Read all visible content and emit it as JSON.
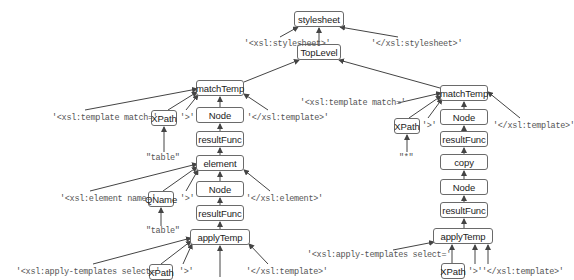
{
  "diagram": {
    "type": "parse-tree",
    "nodes": [
      {
        "id": "stylesheet",
        "label": "stylesheet",
        "x": 294,
        "y": 11,
        "w": 50,
        "h": 16
      },
      {
        "id": "toplevel",
        "label": "TopLevel",
        "x": 297,
        "y": 44,
        "w": 44,
        "h": 16
      },
      {
        "id": "l_matchtemp",
        "label": "matchTemp",
        "x": 196,
        "y": 80,
        "w": 48,
        "h": 16
      },
      {
        "id": "l_xpath",
        "label": "XPath",
        "x": 151,
        "y": 110,
        "w": 26,
        "h": 16
      },
      {
        "id": "l_node1",
        "label": "Node",
        "x": 196,
        "y": 107,
        "w": 48,
        "h": 16
      },
      {
        "id": "l_resultfunc1",
        "label": "resultFunc",
        "x": 196,
        "y": 131,
        "w": 48,
        "h": 16
      },
      {
        "id": "l_element",
        "label": "element",
        "x": 196,
        "y": 155,
        "w": 48,
        "h": 16
      },
      {
        "id": "l_qname",
        "label": "QName",
        "x": 148,
        "y": 191,
        "w": 26,
        "h": 16
      },
      {
        "id": "l_node2",
        "label": "Node",
        "x": 196,
        "y": 181,
        "w": 48,
        "h": 16
      },
      {
        "id": "l_resultfunc2",
        "label": "resultFunc",
        "x": 196,
        "y": 205,
        "w": 48,
        "h": 16
      },
      {
        "id": "l_applytemp",
        "label": "applyTemp",
        "x": 190,
        "y": 229,
        "w": 60,
        "h": 16
      },
      {
        "id": "l_xpath2",
        "label": "XPath",
        "x": 149,
        "y": 264,
        "w": 24,
        "h": 16
      },
      {
        "id": "r_matchtemp",
        "label": "matchTemp",
        "x": 440,
        "y": 85,
        "w": 48,
        "h": 16
      },
      {
        "id": "r_xpath",
        "label": "XPath",
        "x": 394,
        "y": 118,
        "w": 26,
        "h": 16
      },
      {
        "id": "r_node1",
        "label": "Node",
        "x": 440,
        "y": 109,
        "w": 48,
        "h": 16
      },
      {
        "id": "r_resultfunc1",
        "label": "resultFunc",
        "x": 440,
        "y": 131,
        "w": 48,
        "h": 16
      },
      {
        "id": "r_copy",
        "label": "copy",
        "x": 440,
        "y": 154,
        "w": 48,
        "h": 16
      },
      {
        "id": "r_node2",
        "label": "Node",
        "x": 440,
        "y": 179,
        "w": 48,
        "h": 16
      },
      {
        "id": "r_resultfunc2",
        "label": "resultFunc",
        "x": 440,
        "y": 202,
        "w": 48,
        "h": 16
      },
      {
        "id": "r_applytemp",
        "label": "applyTemp",
        "x": 433,
        "y": 228,
        "w": 60,
        "h": 16
      },
      {
        "id": "r_xpath2",
        "label": "XPath",
        "x": 441,
        "y": 263,
        "w": 24,
        "h": 16
      }
    ],
    "literals": [
      {
        "id": "lit_ss_open",
        "text": "'<xsl:stylesheet>'",
        "x": 244,
        "y": 39
      },
      {
        "id": "lit_ss_close",
        "text": "'</xsl:stylesheet>'",
        "x": 371,
        "y": 39
      },
      {
        "id": "lit_l_tmpl_open",
        "text": "'<xsl:template match='",
        "x": 52,
        "y": 113
      },
      {
        "id": "lit_l_gt1",
        "text": "'>'",
        "x": 180,
        "y": 113
      },
      {
        "id": "lit_l_tmpl_close",
        "text": "'</xsl:template>'",
        "x": 247,
        "y": 113
      },
      {
        "id": "lit_l_table1",
        "text": "\"table\"",
        "x": 146,
        "y": 157
      },
      {
        "id": "lit_l_elem_open",
        "text": "'<xsl:element name='",
        "x": 60,
        "y": 194
      },
      {
        "id": "lit_l_gt2",
        "text": "'>'",
        "x": 180,
        "y": 194
      },
      {
        "id": "lit_l_elem_close",
        "text": "'</xsl:element>'",
        "x": 246,
        "y": 194
      },
      {
        "id": "lit_l_table2",
        "text": "\"table\"",
        "x": 146,
        "y": 230
      },
      {
        "id": "lit_l_apply_open",
        "text": "'<xsl:apply-templates select='",
        "x": 16,
        "y": 267
      },
      {
        "id": "lit_l_gt3",
        "text": "'>'",
        "x": 179,
        "y": 267
      },
      {
        "id": "lit_l_tmpl_close2",
        "text": "'</xsl:template>'",
        "x": 246,
        "y": 267
      },
      {
        "id": "lit_r_tmpl_open",
        "text": "'<xsl:template match='",
        "x": 300,
        "y": 101
      },
      {
        "id": "lit_r_gt1",
        "text": "'>'",
        "x": 422,
        "y": 121
      },
      {
        "id": "lit_r_tmpl_close",
        "text": "'</xsl:template>'",
        "x": 493,
        "y": 121
      },
      {
        "id": "lit_r_star",
        "text": "\"*\"",
        "x": 399,
        "y": 157
      },
      {
        "id": "lit_r_apply_open",
        "text": "'<xsl:apply-templates select='",
        "x": 307,
        "y": 253
      },
      {
        "id": "lit_r_gt2",
        "text": "'>'",
        "x": 470,
        "y": 267
      },
      {
        "id": "lit_r_tmpl_close2",
        "text": "'</xsl:template>'",
        "x": 483,
        "y": 267
      }
    ]
  }
}
